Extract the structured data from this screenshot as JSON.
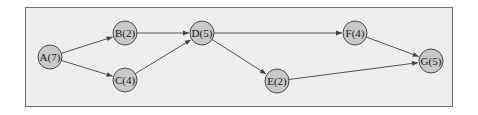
{
  "diagram": {
    "type": "directed-graph",
    "colors": {
      "frame_background": "#eeeeee",
      "frame_border": "#6e6e6e",
      "node_fill": "#c8c8c8",
      "node_stroke": "#4a4a4a",
      "edge": "#555555"
    },
    "nodes": [
      {
        "id": "A",
        "label": "A(7)",
        "duration": 7,
        "x": 50,
        "y": 57
      },
      {
        "id": "B",
        "label": "B(2)",
        "duration": 2,
        "x": 125,
        "y": 33
      },
      {
        "id": "C",
        "label": "C(4)",
        "duration": 4,
        "x": 125,
        "y": 80
      },
      {
        "id": "D",
        "label": "D(5)",
        "duration": 5,
        "x": 202,
        "y": 33
      },
      {
        "id": "E",
        "label": "E(2)",
        "duration": 2,
        "x": 277,
        "y": 81
      },
      {
        "id": "F",
        "label": "F(4)",
        "duration": 4,
        "x": 355,
        "y": 33
      },
      {
        "id": "G",
        "label": "G(5)",
        "duration": 5,
        "x": 431,
        "y": 61
      }
    ],
    "edges": [
      {
        "from": "A",
        "to": "B"
      },
      {
        "from": "A",
        "to": "C"
      },
      {
        "from": "B",
        "to": "D"
      },
      {
        "from": "C",
        "to": "D"
      },
      {
        "from": "D",
        "to": "F"
      },
      {
        "from": "D",
        "to": "E"
      },
      {
        "from": "F",
        "to": "G"
      },
      {
        "from": "E",
        "to": "G"
      }
    ]
  }
}
